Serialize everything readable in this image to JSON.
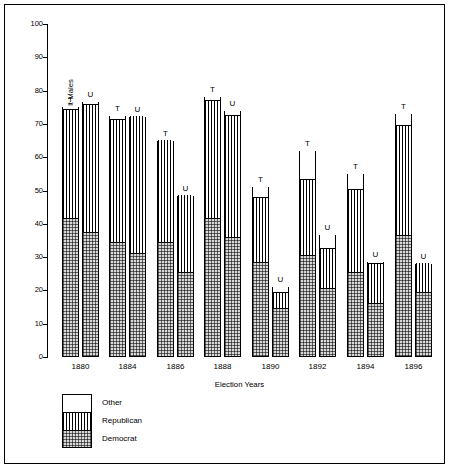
{
  "chart_data": {
    "type": "bar",
    "title": "",
    "xlabel": "Election Years",
    "ylabel": "Percentage of Adult Males",
    "ylim": [
      0,
      100
    ],
    "yticks": [
      0,
      10,
      20,
      30,
      40,
      50,
      60,
      70,
      80,
      90,
      100
    ],
    "ytick_labels": [
      "0",
      "10",
      "20",
      "30",
      "40",
      "50",
      "60",
      "70",
      "80",
      "90",
      "100"
    ],
    "grid": false,
    "legend_position": "below-axes-left",
    "stacked": true,
    "series_order": [
      "Democrat",
      "Republican",
      "Other"
    ],
    "legend": [
      {
        "label": "Other",
        "pattern": "blank"
      },
      {
        "label": "Republican",
        "pattern": "vertical-lines"
      },
      {
        "label": "Democrat",
        "pattern": "dotted-stipple"
      }
    ],
    "bar_tags": {
      "T": "Turnout bar",
      "U": "Unadjusted bar"
    },
    "categories": [
      "1880",
      "1884",
      "1886",
      "1888",
      "1890",
      "1892",
      "1894",
      "1896"
    ],
    "groups": [
      {
        "year": "1880",
        "bars": [
          {
            "tag": "T",
            "total": 75.0,
            "democrat": 41.0,
            "republican": 33.0,
            "other": 1.0
          },
          {
            "tag": "U",
            "total": 76.5,
            "democrat": 37.0,
            "republican": 38.5,
            "other": 1.0
          }
        ]
      },
      {
        "year": "1884",
        "bars": [
          {
            "tag": "T",
            "total": 72.5,
            "democrat": 34.0,
            "republican": 37.0,
            "other": 1.5
          },
          {
            "tag": "U",
            "total": 72.0,
            "democrat": 30.5,
            "republican": 41.5,
            "other": 0.0
          }
        ]
      },
      {
        "year": "1886",
        "bars": [
          {
            "tag": "T",
            "total": 65.0,
            "democrat": 34.0,
            "republican": 31.0,
            "other": 0.0
          },
          {
            "tag": "U",
            "total": 48.5,
            "democrat": 25.0,
            "republican": 23.5,
            "other": 0.0
          }
        ]
      },
      {
        "year": "1888",
        "bars": [
          {
            "tag": "T",
            "total": 78.0,
            "democrat": 41.0,
            "republican": 35.5,
            "other": 1.5
          },
          {
            "tag": "U",
            "total": 74.0,
            "democrat": 35.5,
            "republican": 36.5,
            "other": 2.0
          }
        ]
      },
      {
        "year": "1890",
        "bars": [
          {
            "tag": "T",
            "total": 51.0,
            "democrat": 28.0,
            "republican": 19.5,
            "other": 3.5
          },
          {
            "tag": "U",
            "total": 21.0,
            "democrat": 14.0,
            "republican": 5.0,
            "other": 2.0
          }
        ]
      },
      {
        "year": "1892",
        "bars": [
          {
            "tag": "T",
            "total": 62.0,
            "democrat": 30.0,
            "republican": 23.0,
            "other": 9.0
          },
          {
            "tag": "U",
            "total": 36.5,
            "democrat": 20.0,
            "republican": 12.0,
            "other": 4.5
          }
        ]
      },
      {
        "year": "1894",
        "bars": [
          {
            "tag": "T",
            "total": 55.0,
            "democrat": 25.0,
            "republican": 25.0,
            "other": 5.0
          },
          {
            "tag": "U",
            "total": 28.5,
            "democrat": 15.5,
            "republican": 12.0,
            "other": 1.0
          }
        ]
      },
      {
        "year": "1896",
        "bars": [
          {
            "tag": "T",
            "total": 73.0,
            "democrat": 36.0,
            "republican": 33.0,
            "other": 4.0
          },
          {
            "tag": "U",
            "total": 28.0,
            "democrat": 19.0,
            "republican": 9.0,
            "other": 0.0
          }
        ]
      }
    ]
  }
}
